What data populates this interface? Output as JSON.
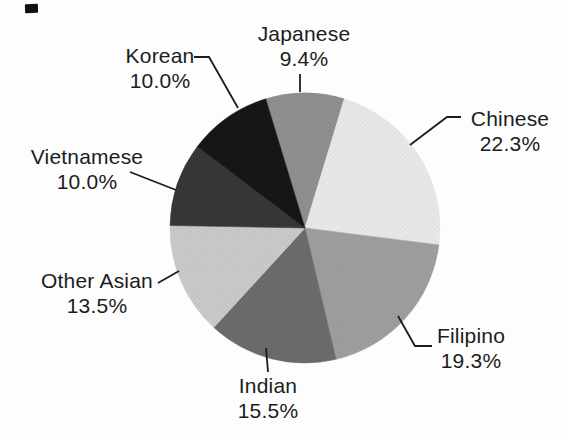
{
  "page": {
    "background": "#fdfdfd",
    "text_color": "#1c1c1c",
    "leader_line_color": "#1c1c1c",
    "scan_artifact_color": "#101010"
  },
  "chart_data": {
    "type": "pie",
    "title": "",
    "legend_position": "none",
    "label_style": "outside-with-leader-lines",
    "direction": "clockwise",
    "start_angle_deg": -16.92,
    "total": 100.0,
    "center": {
      "x": 305,
      "y": 228
    },
    "radius": 135,
    "slices": [
      {
        "label": "Japanese",
        "value": 9.4,
        "display": "9.4%",
        "color": "#8f8f8f"
      },
      {
        "label": "Chinese",
        "value": 22.3,
        "display": "22.3%",
        "color": "#e8e8e8"
      },
      {
        "label": "Filipino",
        "value": 19.3,
        "display": "19.3%",
        "color": "#9e9e9e"
      },
      {
        "label": "Indian",
        "value": 15.5,
        "display": "15.5%",
        "color": "#6b6b6b"
      },
      {
        "label": "Other Asian",
        "value": 13.5,
        "display": "13.5%",
        "color": "#c9c9c9"
      },
      {
        "label": "Vietnamese",
        "value": 10.0,
        "display": "10.0%",
        "color": "#373737"
      },
      {
        "label": "Korean",
        "value": 10.0,
        "display": "10.0%",
        "color": "#161616"
      }
    ]
  }
}
